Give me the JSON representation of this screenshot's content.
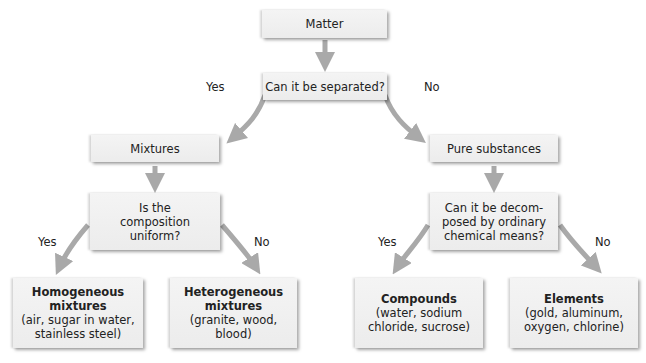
{
  "diagram": {
    "nodes": {
      "matter": {
        "label": "Matter"
      },
      "separated": {
        "label": "Can it be separated?"
      },
      "mixtures": {
        "label": "Mixtures"
      },
      "pure": {
        "label": "Pure substances"
      },
      "composition": {
        "line1": "Is the",
        "line2": "composition",
        "line3": "uniform?"
      },
      "decompose": {
        "line1": "Can it be decom-",
        "line2": "posed by ordinary",
        "line3": "chemical means?"
      },
      "homogeneous": {
        "title1": "Homogeneous",
        "title2": "mixtures",
        "ex1": "(air, sugar in water,",
        "ex2": "stainless steel)"
      },
      "heterogeneous": {
        "title1": "Heterogeneous",
        "title2": "mixtures",
        "ex1": "(granite, wood,",
        "ex2": "blood)"
      },
      "compounds": {
        "title1": "Compounds",
        "ex1": "(water, sodium",
        "ex2": "chloride, sucrose)"
      },
      "elements": {
        "title1": "Elements",
        "ex1": "(gold, aluminum,",
        "ex2": "oxygen, chlorine)"
      }
    },
    "edge_labels": {
      "sep_yes": "Yes",
      "sep_no": "No",
      "comp_yes": "Yes",
      "comp_no": "No",
      "dec_yes": "Yes",
      "dec_no": "No"
    },
    "colors": {
      "arrow": "#a9a9a9",
      "box": "#efefef"
    }
  }
}
